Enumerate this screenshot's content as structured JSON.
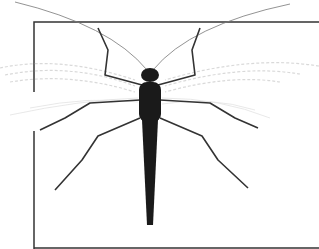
{
  "image": {
    "subject": "insect illustration (stonefly, dorsal view)",
    "background_color": "#ffffff",
    "frame_color": "#333333",
    "body_color": "#1a1a1a",
    "wing_color": "#c8c8c8"
  }
}
